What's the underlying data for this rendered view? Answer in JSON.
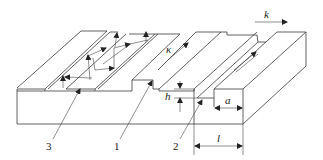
{
  "diagram": {
    "type": "waveguide-structures-perspective",
    "labels": {
      "wave_vector": "k",
      "kappa": "κ",
      "height": "h",
      "width_a": "a",
      "width_l": "l",
      "callout_3": "3",
      "callout_1": "1",
      "callout_2": "2"
    },
    "parts": [
      {
        "id": "3",
        "description": "thin-film slab waveguide with zig-zag ray paths"
      },
      {
        "id": "1",
        "description": "ridge (rib) waveguide with propagation arrow κ"
      },
      {
        "id": "2",
        "description": "channel / strip waveguide with dimensions h, a, l"
      }
    ],
    "colors": {
      "line": "#3a3a3a",
      "background": "#ffffff"
    }
  }
}
